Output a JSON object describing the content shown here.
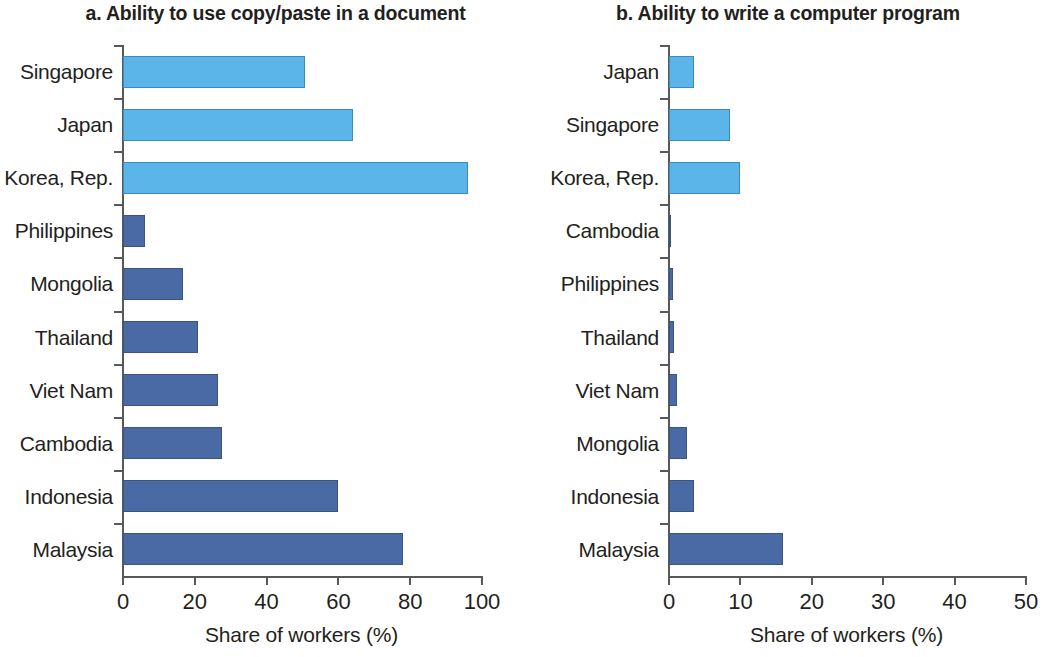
{
  "figure": {
    "shared_axis_title": "Share of workers (%)"
  },
  "panels": [
    {
      "id": "panel-a",
      "title": "a. Ability to use copy/paste in a document"
    },
    {
      "id": "panel-b",
      "title": "b. Ability to write a computer program"
    }
  ],
  "chart_data": [
    {
      "type": "bar",
      "orientation": "horizontal",
      "title": "a. Ability to use copy/paste in a document",
      "xlabel": "Share of workers (%)",
      "ylabel": "",
      "xlim": [
        0,
        100
      ],
      "xticks": [
        0,
        20,
        40,
        60,
        80,
        100
      ],
      "xtick_labels": [
        "0",
        "20",
        "40",
        "60",
        "80",
        "100"
      ],
      "grid": false,
      "legend": "none",
      "categories": [
        "Singapore",
        "Japan",
        "Korea, Rep.",
        "Philippines",
        "Mongolia",
        "Thailand",
        "Viet Nam",
        "Cambodia",
        "Indonesia",
        "Malaysia"
      ],
      "values": [
        50.7,
        64.0,
        96.0,
        6.0,
        16.7,
        21.0,
        26.5,
        27.5,
        60.0,
        78.0
      ],
      "bar_colors": [
        "#5bb5e8",
        "#5bb5e8",
        "#5bb5e8",
        "#4a6aa5",
        "#4a6aa5",
        "#4a6aa5",
        "#4a6aa5",
        "#4a6aa5",
        "#4a6aa5",
        "#4a6aa5"
      ]
    },
    {
      "type": "bar",
      "orientation": "horizontal",
      "title": "b. Ability to write a computer program",
      "xlabel": "Share of workers (%)",
      "ylabel": "",
      "xlim": [
        0,
        50
      ],
      "xticks": [
        0,
        10,
        20,
        30,
        40,
        50
      ],
      "xtick_labels": [
        "0",
        "10",
        "20",
        "30",
        "40",
        "50"
      ],
      "grid": false,
      "legend": "none",
      "categories": [
        "Japan",
        "Singapore",
        "Korea, Rep.",
        "Cambodia",
        "Philippines",
        "Thailand",
        "Viet Nam",
        "Mongolia",
        "Indonesia",
        "Malaysia"
      ],
      "values": [
        3.5,
        8.5,
        10.0,
        0.1,
        0.5,
        0.7,
        1.1,
        2.5,
        3.5,
        16.0
      ],
      "bar_colors": [
        "#5bb5e8",
        "#5bb5e8",
        "#5bb5e8",
        "#4a6aa5",
        "#4a6aa5",
        "#4a6aa5",
        "#4a6aa5",
        "#4a6aa5",
        "#4a6aa5",
        "#4a6aa5"
      ]
    }
  ],
  "colors": {
    "light_blue": "#5bb5e8",
    "dark_blue": "#4a6aa5",
    "axis": "#58595b",
    "text": "#231f20"
  }
}
